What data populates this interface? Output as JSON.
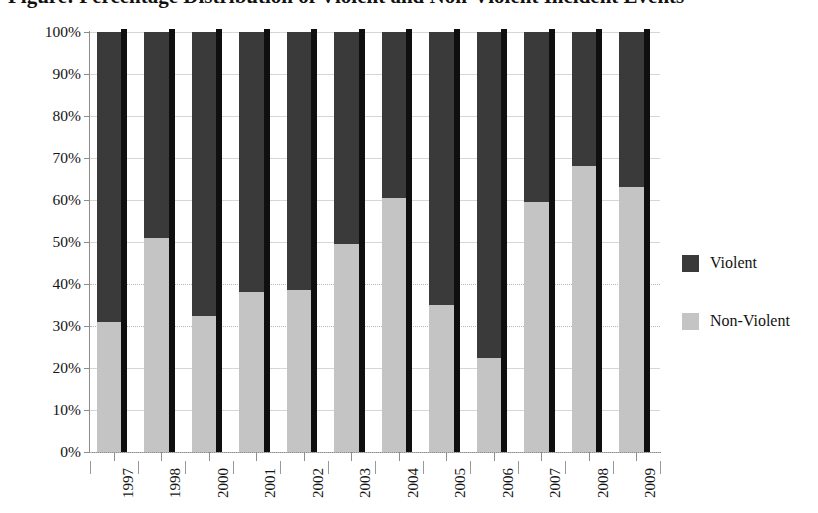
{
  "chart_data": {
    "type": "bar",
    "subtype": "stacked-percent",
    "title": "Figure: Percentage Distribution of Violent and Non-Violent Incident Events",
    "xlabel": "",
    "ylabel": "",
    "ylim": [
      0,
      100
    ],
    "ytick_labels": [
      "0%",
      "10%",
      "20%",
      "30%",
      "40%",
      "50%",
      "60%",
      "70%",
      "80%",
      "90%",
      "100%"
    ],
    "ytick_values": [
      0,
      10,
      20,
      30,
      40,
      50,
      60,
      70,
      80,
      90,
      100
    ],
    "grid": true,
    "legend_position": "right",
    "categories": [
      "1997",
      "1998",
      "2000",
      "2001",
      "2002",
      "2003",
      "2004",
      "2005",
      "2006",
      "2007",
      "2008",
      "2009"
    ],
    "series": [
      {
        "name": "Violent",
        "color": "#3a3a3a",
        "values": [
          69.0,
          49.0,
          67.5,
          62.0,
          61.5,
          50.5,
          39.5,
          65.0,
          77.5,
          40.5,
          32.0,
          37.0
        ]
      },
      {
        "name": "Non-Violent",
        "color": "#c4c4c4",
        "values": [
          31.0,
          51.0,
          32.5,
          38.0,
          38.5,
          49.5,
          60.5,
          35.0,
          22.5,
          59.5,
          68.0,
          63.0
        ]
      }
    ]
  },
  "legend": {
    "items": [
      {
        "label": "Violent",
        "color": "#3a3a3a"
      },
      {
        "label": "Non-Violent",
        "color": "#c4c4c4"
      }
    ]
  },
  "colors": {
    "violent": "#3a3a3a",
    "non_violent": "#c4c4c4",
    "bar_edge": "#0f0f0f",
    "axis": "#8d8d8d",
    "grid": "#d6d6d6",
    "background": "#ffffff"
  }
}
